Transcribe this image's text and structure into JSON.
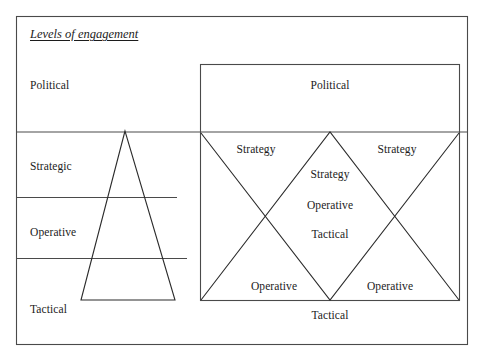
{
  "figure": {
    "title": "Levels of engagement",
    "left_panel": {
      "name": "levels-scale",
      "rows": [
        {
          "label": "Political"
        },
        {
          "label": "Strategic"
        },
        {
          "label": "Operative"
        },
        {
          "label": "Tactical"
        }
      ]
    },
    "right_panel": {
      "name": "engagement-matrix",
      "top_band_label": "Political",
      "bottom_band_label": "Tactical",
      "upper_left_label": "Strategy",
      "upper_right_label": "Strategy",
      "lower_left_label": "Operative",
      "lower_right_label": "Operative",
      "center_stack": [
        "Strategy",
        "Operative",
        "Tactical"
      ]
    }
  },
  "style": {
    "line_color": "#2b2b2b",
    "frame_color": "#4a4a4a",
    "background": "#ffffff",
    "text_color": "#1c1c1c"
  }
}
